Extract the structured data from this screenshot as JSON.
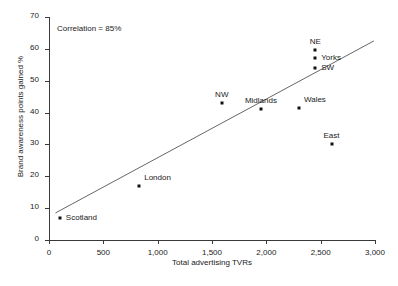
{
  "chart_data": {
    "type": "scatter",
    "title": "",
    "xlabel": "Total advertising TVRs",
    "ylabel": "Brand awareness points gained %",
    "xlim": [
      0,
      3000
    ],
    "ylim": [
      0,
      70
    ],
    "xticks": [
      "0",
      "500",
      "1,000",
      "1,500",
      "2,000",
      "2,500",
      "3,000"
    ],
    "xtick_values": [
      0,
      500,
      1000,
      1500,
      2000,
      2500,
      3000
    ],
    "yticks": [
      "0",
      "10",
      "20",
      "30",
      "40",
      "50",
      "60",
      "70"
    ],
    "ytick_values": [
      0,
      10,
      20,
      30,
      40,
      50,
      60,
      70
    ],
    "grid": false,
    "legend": null,
    "annotations": [
      {
        "text": "Correlation = 85%"
      }
    ],
    "points": [
      {
        "label": "Scotland",
        "x": 100,
        "y": 7,
        "label_pos": "right"
      },
      {
        "label": "London",
        "x": 830,
        "y": 17,
        "label_pos": "above-right"
      },
      {
        "label": "NW",
        "x": 1590,
        "y": 43,
        "label_pos": "above"
      },
      {
        "label": "Midlands",
        "x": 1950,
        "y": 41,
        "label_pos": "above"
      },
      {
        "label": "Wales",
        "x": 2300,
        "y": 41.5,
        "label_pos": "above-right"
      },
      {
        "label": "SW",
        "x": 2450,
        "y": 54,
        "label_pos": "right"
      },
      {
        "label": "Yorks",
        "x": 2450,
        "y": 57,
        "label_pos": "right"
      },
      {
        "label": "NE",
        "x": 2450,
        "y": 59.5,
        "label_pos": "above"
      },
      {
        "label": "East",
        "x": 2600,
        "y": 30,
        "label_pos": "above"
      }
    ],
    "trend_line": {
      "x1": 60,
      "y1": 8.5,
      "x2": 2990,
      "y2": 62.5
    },
    "colors": {
      "point": "#111111",
      "line": "#555555",
      "axis": "#3a3a3a",
      "text": "#1a1a1a",
      "background": "#ffffff"
    }
  }
}
